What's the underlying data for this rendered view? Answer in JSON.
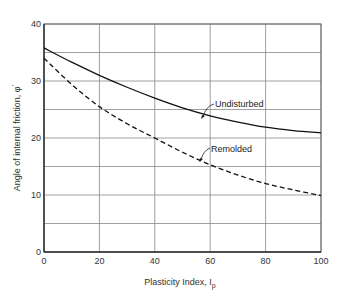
{
  "chart_data": {
    "type": "line",
    "title": "",
    "xlabel": "Plasticity Index, I_p",
    "ylabel": "Angle of internal friction, φ'",
    "xlim": [
      0,
      100
    ],
    "ylim": [
      0,
      40
    ],
    "x_ticks": [
      0,
      20,
      40,
      60,
      80,
      100
    ],
    "y_ticks": [
      0,
      10,
      20,
      30,
      40
    ],
    "grid": true,
    "grid_y_minor": [
      5,
      15,
      25,
      35
    ],
    "legend": "inline annotations",
    "x": [
      0,
      10,
      20,
      30,
      40,
      50,
      60,
      70,
      80,
      90,
      100
    ],
    "series": [
      {
        "name": "Undisturbed",
        "style": "solid",
        "values": [
          35.8,
          33.3,
          31.0,
          28.9,
          27.0,
          25.3,
          23.9,
          22.8,
          21.9,
          21.3,
          20.9
        ]
      },
      {
        "name": "Remolded",
        "style": "dashed",
        "values": [
          34.0,
          29.4,
          25.5,
          22.5,
          20.0,
          17.5,
          15.3,
          13.5,
          12.0,
          10.9,
          9.9
        ]
      }
    ],
    "annotations": [
      {
        "text": "Undisturbed",
        "x": 56,
        "y": 24.3
      },
      {
        "text": "Remolded",
        "x": 56,
        "y": 15.8
      }
    ]
  },
  "labels": {
    "xlabel_main": "Plasticity Index,  I",
    "xlabel_sub": "p",
    "ylabel_main": "Angle of internal friction,  φ",
    "ylabel_sup": "'",
    "anno_undisturbed": "Undisturbed",
    "anno_remolded": "Remolded",
    "x_ticks": [
      "0",
      "20",
      "40",
      "60",
      "80",
      "100"
    ],
    "y_ticks": [
      "0",
      "10",
      "20",
      "30",
      "40"
    ]
  }
}
